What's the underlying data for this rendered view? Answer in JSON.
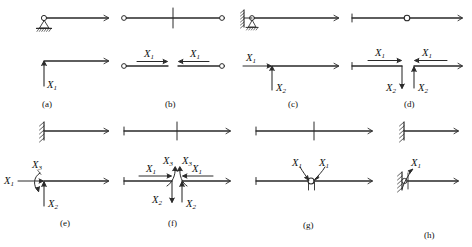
{
  "figure": {
    "type": "structural-mechanics-diagram",
    "stroke_color": "#2a2a2a",
    "background_color": "#ffffff"
  },
  "panels": [
    {
      "id": "a",
      "caption": "(a)",
      "top": {
        "supports": [
          "pin-support-hinge"
        ],
        "cut": "none"
      },
      "bottom": {
        "forces": [
          {
            "name": "X1",
            "label": "X",
            "sub": "1",
            "kind": "vertical-force",
            "direction": "down"
          }
        ]
      }
    },
    {
      "id": "b",
      "caption": "(b)",
      "top": {
        "supports": [
          "hinge-left",
          "hinge-right"
        ],
        "cut": "mid-span-vertical-cut"
      },
      "bottom": {
        "forces": [
          {
            "name": "X1-left",
            "label": "X",
            "sub": "1",
            "kind": "axial-force",
            "direction": "right"
          },
          {
            "name": "X1-right",
            "label": "X",
            "sub": "1",
            "kind": "axial-force",
            "direction": "left"
          }
        ]
      }
    },
    {
      "id": "c",
      "caption": "(c)",
      "top": {
        "supports": [
          "hatched-wall-left",
          "hinge",
          "roller-support"
        ],
        "cut": "none"
      },
      "bottom": {
        "forces": [
          {
            "name": "X1",
            "label": "X",
            "sub": "1",
            "kind": "horizontal-force",
            "direction": "right"
          },
          {
            "name": "X2",
            "label": "X",
            "sub": "2",
            "kind": "vertical-force",
            "direction": "up"
          }
        ]
      }
    },
    {
      "id": "d",
      "caption": "(d)",
      "top": {
        "supports": [
          "end-tick-left",
          "end-tick-right"
        ],
        "cut": "mid-span-hinge-circle"
      },
      "bottom": {
        "forces": [
          {
            "name": "X1-left",
            "label": "X",
            "sub": "1",
            "kind": "axial-force",
            "direction": "right"
          },
          {
            "name": "X2-left",
            "label": "X",
            "sub": "2",
            "kind": "shear-force",
            "direction": "down"
          },
          {
            "name": "X1-right",
            "label": "X",
            "sub": "1",
            "kind": "axial-force",
            "direction": "left"
          },
          {
            "name": "X2-right",
            "label": "X",
            "sub": "2",
            "kind": "shear-force",
            "direction": "up"
          }
        ]
      }
    },
    {
      "id": "e",
      "caption": "(e)",
      "top": {
        "supports": [
          "fixed-hatched-wall-left"
        ],
        "cut": "none"
      },
      "bottom": {
        "forces": [
          {
            "name": "X1",
            "label": "X",
            "sub": "1",
            "kind": "horizontal-force",
            "direction": "right"
          },
          {
            "name": "X2",
            "label": "X",
            "sub": "2",
            "kind": "vertical-force",
            "direction": "up"
          },
          {
            "name": "X3",
            "label": "X",
            "sub": "3",
            "kind": "moment",
            "direction": "curved"
          }
        ]
      }
    },
    {
      "id": "f",
      "caption": "(f)",
      "top": {
        "supports": [
          "end-tick-left",
          "end-tick-right"
        ],
        "cut": "mid-span-vertical-cut"
      },
      "bottom": {
        "forces": [
          {
            "name": "X1-left",
            "label": "X",
            "sub": "1",
            "kind": "axial-force",
            "direction": "right"
          },
          {
            "name": "X2-left",
            "label": "X",
            "sub": "2",
            "kind": "shear-force",
            "direction": "down"
          },
          {
            "name": "X3-left",
            "label": "X",
            "sub": "3",
            "kind": "moment",
            "direction": "curved"
          },
          {
            "name": "X1-right",
            "label": "X",
            "sub": "1",
            "kind": "axial-force",
            "direction": "left"
          },
          {
            "name": "X2-right",
            "label": "X",
            "sub": "2",
            "kind": "shear-force",
            "direction": "up"
          },
          {
            "name": "X3-right",
            "label": "X",
            "sub": "3",
            "kind": "moment",
            "direction": "curved"
          }
        ]
      }
    },
    {
      "id": "g",
      "caption": "(g)",
      "top": {
        "supports": [
          "end-tick-left",
          "end-tick-right"
        ],
        "cut": "mid-span-vertical-cut"
      },
      "bottom": {
        "forces": [
          {
            "name": "X1-left",
            "label": "X",
            "sub": "1",
            "kind": "moment",
            "direction": "curved"
          },
          {
            "name": "X1-right",
            "label": "X",
            "sub": "1",
            "kind": "moment",
            "direction": "curved"
          }
        ],
        "hinge": "mid-span-hinge-circle"
      }
    },
    {
      "id": "h",
      "caption": "(h)",
      "top": {
        "supports": [
          "fixed-hatched-wall-left"
        ],
        "cut": "none"
      },
      "bottom": {
        "forces": [
          {
            "name": "X1",
            "label": "X",
            "sub": "1",
            "kind": "moment",
            "direction": "curved"
          }
        ],
        "hinge": "hinge-at-wall"
      }
    }
  ],
  "labels": {
    "X": "X",
    "sub1": "1",
    "sub2": "2",
    "sub3": "3",
    "cap_a": "(a)",
    "cap_b": "(b)",
    "cap_c": "(c)",
    "cap_d": "(d)",
    "cap_e": "(e)",
    "cap_f": "(f)",
    "cap_g": "(g)",
    "cap_h": "(h)"
  }
}
